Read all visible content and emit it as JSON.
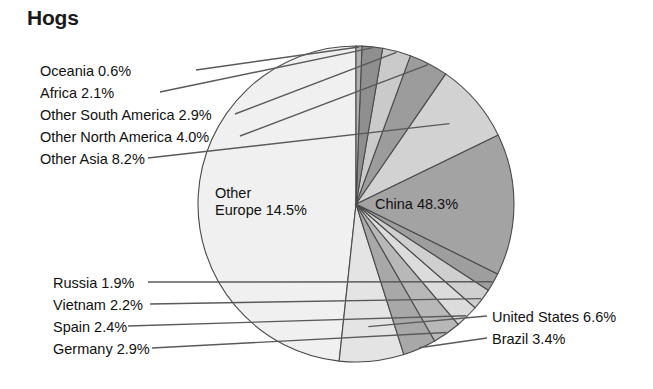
{
  "chart_data": {
    "type": "pie",
    "title": "Hogs",
    "unit": "%",
    "total": 100.0,
    "start_angle_deg": 90,
    "direction": "counterclockwise",
    "legend_position": "callout-labels",
    "grid": false,
    "slices": [
      {
        "name": "China",
        "label": "China 48.3%",
        "value": 48.3,
        "color": "#f0f0f0"
      },
      {
        "name": "United States",
        "label": "United States 6.6%",
        "value": 6.6,
        "color": "#e4e4e4"
      },
      {
        "name": "Brazil",
        "label": "Brazil 3.4%",
        "value": 3.4,
        "color": "#a8a8a8"
      },
      {
        "name": "Germany",
        "label": "Germany 2.9%",
        "value": 2.9,
        "color": "#b8b8b8"
      },
      {
        "name": "Spain",
        "label": "Spain 2.4%",
        "value": 2.4,
        "color": "#dcdcdc"
      },
      {
        "name": "Vietnam",
        "label": "Vietnam 2.2%",
        "value": 2.2,
        "color": "#cfcfcf"
      },
      {
        "name": "Russia",
        "label": "Russia 1.9%",
        "value": 1.9,
        "color": "#9e9e9e"
      },
      {
        "name": "Other Europe",
        "label": "Other\nEurope 14.5%",
        "value": 14.5,
        "color": "#a3a3a3"
      },
      {
        "name": "Other Asia",
        "label": "Other Asia 8.2%",
        "value": 8.2,
        "color": "#d2d2d2"
      },
      {
        "name": "Other North America",
        "label": "Other North America 4.0%",
        "value": 4.0,
        "color": "#9c9c9c"
      },
      {
        "name": "Other South America",
        "label": "Other South America 2.9%",
        "value": 2.9,
        "color": "#cacaca"
      },
      {
        "name": "Africa",
        "label": "Africa 2.1%",
        "value": 2.1,
        "color": "#8f8f8f"
      },
      {
        "name": "Oceania",
        "label": "Oceania 0.6%",
        "value": 0.6,
        "color": "#b0b0b0"
      }
    ]
  },
  "labels": {
    "oceania": "Oceania 0.6%",
    "africa": "Africa 2.1%",
    "other_south_america": "Other South America 2.9%",
    "other_north_america": "Other North America 4.0%",
    "other_asia": "Other Asia 8.2%",
    "other_europe_line1": "Other",
    "other_europe_line2": "Europe 14.5%",
    "china": "China 48.3%",
    "russia": "Russia 1.9%",
    "vietnam": "Vietnam 2.2%",
    "spain": "Spain 2.4%",
    "germany": "Germany 2.9%",
    "united_states": "United States 6.6%",
    "brazil": "Brazil 3.4%"
  },
  "style": {
    "stroke": "#4a4a4a",
    "leader": "#5a5a5a",
    "background": "#ffffff"
  }
}
